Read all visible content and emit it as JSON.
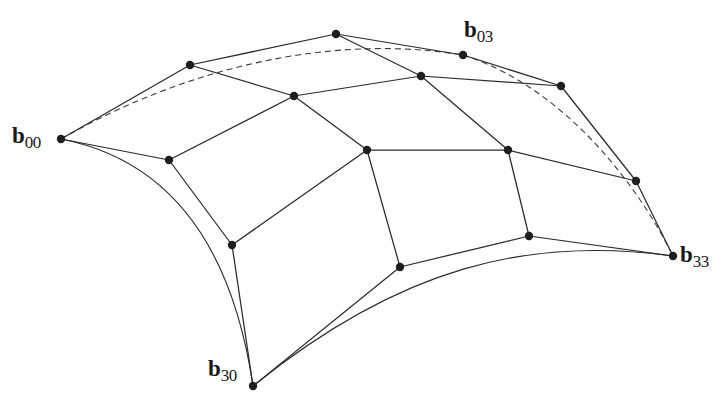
{
  "figure": {
    "colors": {
      "ink": "#2a2a2a",
      "point": "#1e1e1e",
      "background": "#ffffff"
    },
    "control_points": [
      [
        [
          61,
          139
        ],
        [
          190,
          65
        ],
        [
          336,
          34
        ],
        [
          463,
          55
        ]
      ],
      [
        [
          169,
          160
        ],
        [
          294,
          96
        ],
        [
          421,
          76
        ],
        [
          561,
          86
        ]
      ],
      [
        [
          232,
          245
        ],
        [
          367,
          150
        ],
        [
          508,
          150
        ],
        [
          636,
          181
        ]
      ],
      [
        [
          253,
          386
        ],
        [
          400,
          267
        ],
        [
          529,
          236
        ],
        [
          673,
          256
        ]
      ]
    ],
    "labels": [
      {
        "id": "b00",
        "base": "b",
        "sub": "00",
        "x": 12,
        "y": 124
      },
      {
        "id": "b03",
        "base": "b",
        "sub": "03",
        "x": 464,
        "y": 18
      },
      {
        "id": "b30",
        "base": "b",
        "sub": "30",
        "x": 208,
        "y": 357
      },
      {
        "id": "b33",
        "base": "b",
        "sub": "33",
        "x": 680,
        "y": 243
      }
    ]
  }
}
